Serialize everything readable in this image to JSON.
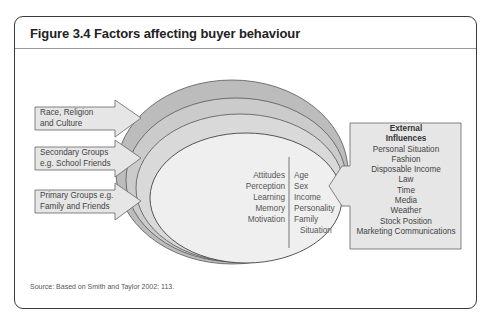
{
  "figure": {
    "title": "Figure 3.4 Factors affecting buyer behaviour",
    "source": "Source: Based on Smith and Taylor 2002: 113."
  },
  "arrows_left": [
    {
      "line1": "Race, Religion",
      "line2": "and Culture"
    },
    {
      "line1": "Secondary Groups",
      "line2": "e.g. School Friends"
    },
    {
      "line1": "Primary Groups e.g.",
      "line2": "Family and Friends"
    }
  ],
  "inner_core": {
    "psychological": [
      "Attitudes",
      "Perception",
      "Learning",
      "Memory",
      "Motivation"
    ],
    "personal": [
      "Age",
      "Sex",
      "Income",
      "Personality",
      "Family",
      "Situation"
    ]
  },
  "external": {
    "heading1": "External",
    "heading2": "Influences",
    "items": [
      "Personal Situation",
      "Fashion",
      "Disposable Income",
      "Law",
      "Time",
      "Media",
      "Weather",
      "Stock Position",
      "Marketing Communications"
    ]
  },
  "colors": {
    "frame": "#3a3a3a",
    "ring_outer": "#bcbcbc",
    "ring_2": "#cbcbcb",
    "ring_3": "#d9d9d9",
    "core": "#efefef",
    "arrow_fill": "#e6e6e6"
  }
}
